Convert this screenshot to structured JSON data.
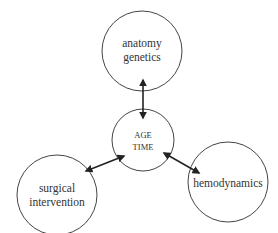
{
  "diagram": {
    "type": "hub-and-spoke",
    "center": {
      "id": "age-time",
      "lines": [
        "AGE",
        "TIME"
      ],
      "cx": 143,
      "cy": 140,
      "r": 31
    },
    "nodes": [
      {
        "id": "anatomy-genetics",
        "lines": [
          "anatomy",
          "genetics"
        ],
        "cx": 142,
        "cy": 51,
        "r": 40
      },
      {
        "id": "surgical-intervention",
        "lines": [
          "surgical",
          "intervention"
        ],
        "cx": 57,
        "cy": 195,
        "r": 40
      },
      {
        "id": "hemodynamics",
        "lines": [
          "hemodynamics"
        ],
        "cx": 228,
        "cy": 182,
        "r": 40
      }
    ],
    "edges": [
      {
        "from": "age-time",
        "to": "anatomy-genetics",
        "bidirectional": true,
        "x1": 143,
        "y1": 118,
        "x2": 143,
        "y2": 80
      },
      {
        "from": "age-time",
        "to": "surgical-intervention",
        "bidirectional": true,
        "x1": 124,
        "y1": 156,
        "x2": 86,
        "y2": 171
      },
      {
        "from": "age-time",
        "to": "hemodynamics",
        "bidirectional": true,
        "x1": 164,
        "y1": 153,
        "x2": 199,
        "y2": 173
      }
    ],
    "colors": {
      "stroke": "#444444",
      "arrow": "#222222",
      "text": "#333333",
      "background": "#ffffff"
    }
  }
}
